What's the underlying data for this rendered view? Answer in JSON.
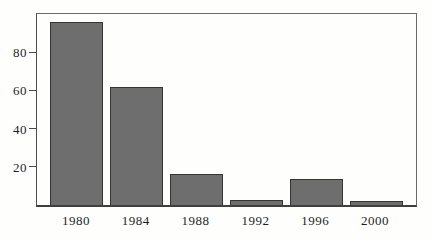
{
  "chart_data": {
    "type": "bar",
    "categories": [
      "1980",
      "1984",
      "1988",
      "1992",
      "1996",
      "2000"
    ],
    "values": [
      96,
      62,
      16,
      2.5,
      13.5,
      2
    ],
    "title": "",
    "xlabel": "",
    "ylabel": "",
    "ylim": [
      0,
      100
    ],
    "yticks": [
      20,
      40,
      60,
      80
    ],
    "grid": false,
    "legend": "none",
    "colors": {
      "bar_fill": "#6e6e6e",
      "bar_border": "#353535",
      "axis": "#4a4a4a",
      "text": "#1e1e1e",
      "background": "#fefefd"
    }
  }
}
